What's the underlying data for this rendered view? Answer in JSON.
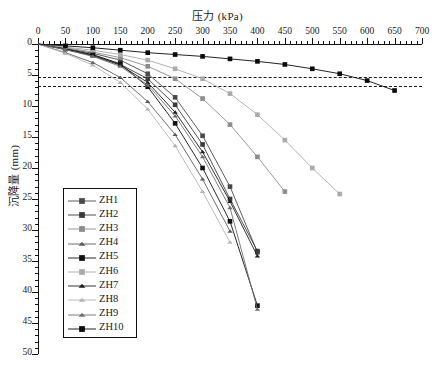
{
  "chart_data": {
    "type": "line",
    "title": "",
    "xlabel": "压力 (kPa)",
    "ylabel": "沉降量 (mm)",
    "xlim": [
      0,
      700
    ],
    "ylim": [
      0,
      50
    ],
    "y_inverted": true,
    "x_axis_position": "top",
    "grid": false,
    "legend_position": "inside-left",
    "xticks": [
      0,
      50,
      100,
      150,
      200,
      250,
      300,
      350,
      400,
      450,
      500,
      550,
      600,
      650,
      700
    ],
    "yticks": [
      0,
      5,
      10,
      15,
      20,
      25,
      30,
      35,
      40,
      45,
      50
    ],
    "x_minor_tick_step": 10,
    "y_minor_tick_step": 1,
    "annotations": [
      {
        "name": "reference-line-upper",
        "type": "hline",
        "y": 5.4
      },
      {
        "name": "reference-line-lower",
        "type": "hline",
        "y": 6.8
      }
    ],
    "series": [
      {
        "name": "ZH1",
        "marker": "square",
        "color": "#4a4a4a",
        "x": [
          0,
          50,
          100,
          150,
          200,
          250,
          300,
          350,
          400
        ],
        "y": [
          0,
          0.7,
          1.5,
          2.6,
          4.8,
          8.6,
          14.8,
          23.0,
          33.6
        ]
      },
      {
        "name": "ZH2",
        "marker": "square",
        "color": "#3a3a3a",
        "x": [
          0,
          50,
          100,
          150,
          200,
          250,
          300,
          350,
          400
        ],
        "y": [
          0,
          0.8,
          1.8,
          3.3,
          5.6,
          9.8,
          16.2,
          25.0,
          33.4
        ]
      },
      {
        "name": "ZH3",
        "marker": "square",
        "color": "#8d8d8d",
        "x": [
          0,
          50,
          100,
          150,
          200,
          250,
          300,
          350,
          400,
          450
        ],
        "y": [
          0,
          0.6,
          1.3,
          2.2,
          3.6,
          5.6,
          8.8,
          13.0,
          18.2,
          23.8
        ]
      },
      {
        "name": "ZH4",
        "marker": "triangle",
        "color": "#5d5d5d",
        "x": [
          0,
          50,
          100,
          150,
          200,
          250,
          300,
          350
        ],
        "y": [
          0,
          1.4,
          3.0,
          5.4,
          9.3,
          14.6,
          21.8,
          30.2
        ]
      },
      {
        "name": "ZH5",
        "marker": "square",
        "color": "#111111",
        "x": [
          0,
          50,
          100,
          150,
          200,
          250,
          300,
          350,
          400
        ],
        "y": [
          0,
          0.8,
          1.7,
          3.2,
          6.9,
          12.8,
          20.0,
          28.6,
          42.2
        ]
      },
      {
        "name": "ZH6",
        "marker": "square",
        "color": "#aaaaaa",
        "x": [
          0,
          50,
          100,
          150,
          200,
          250,
          300,
          350,
          400,
          450,
          500,
          550
        ],
        "y": [
          0,
          0.5,
          1.0,
          1.7,
          2.6,
          4.0,
          5.6,
          8.0,
          11.4,
          15.5,
          20.0,
          24.2
        ]
      },
      {
        "name": "ZH7",
        "marker": "triangle",
        "color": "#1d1d1d",
        "x": [
          0,
          50,
          100,
          150,
          200,
          250,
          300,
          350,
          400
        ],
        "y": [
          0,
          0.9,
          1.9,
          3.4,
          6.2,
          11.0,
          17.4,
          25.4,
          34.2
        ]
      },
      {
        "name": "ZH8",
        "marker": "triangle",
        "color": "#b4b4b4",
        "x": [
          0,
          50,
          100,
          150,
          200,
          250,
          300,
          350
        ],
        "y": [
          0,
          1.5,
          3.4,
          6.2,
          10.5,
          16.4,
          23.8,
          32.0
        ]
      },
      {
        "name": "ZH9",
        "marker": "triangle",
        "color": "#6f6f6f",
        "x": [
          0,
          50,
          100,
          150,
          200,
          250,
          300,
          350,
          400
        ],
        "y": [
          0,
          0.9,
          2.0,
          3.6,
          6.6,
          11.6,
          18.2,
          26.4,
          42.8
        ]
      },
      {
        "name": "ZH10",
        "marker": "square",
        "color": "#0a0a0a",
        "x": [
          0,
          50,
          100,
          150,
          200,
          250,
          300,
          350,
          400,
          450,
          500,
          550,
          600,
          650
        ],
        "y": [
          0,
          0.3,
          0.6,
          1.0,
          1.4,
          1.7,
          2.0,
          2.4,
          2.8,
          3.3,
          4.0,
          4.8,
          5.9,
          7.5
        ]
      }
    ]
  },
  "legend": {
    "items": [
      {
        "label": "ZH1"
      },
      {
        "label": "ZH2"
      },
      {
        "label": "ZH3"
      },
      {
        "label": "ZH4"
      },
      {
        "label": "ZH5"
      },
      {
        "label": "ZH6"
      },
      {
        "label": "ZH7"
      },
      {
        "label": "ZH8"
      },
      {
        "label": "ZH9"
      },
      {
        "label": "ZH10"
      }
    ]
  }
}
